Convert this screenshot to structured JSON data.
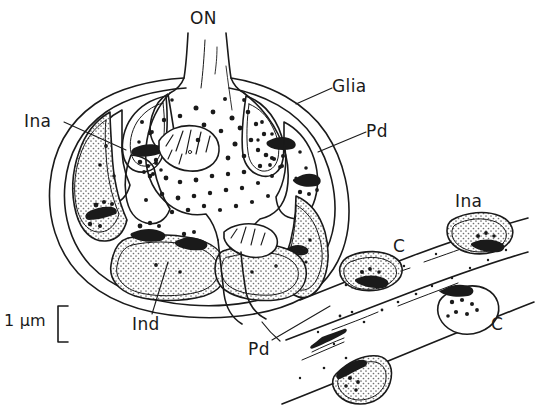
{
  "figure": {
    "domain_description": "Line drawing of a neuronal synaptic glomerulus cross-section",
    "width": 558,
    "height": 412,
    "background_color": "#ffffff",
    "ink_color": "#1a1a1a",
    "stipple_fill_color": "#d9d9d9"
  },
  "labels": {
    "optic_nerve": {
      "text": "ON",
      "x": 190,
      "y": 10
    },
    "glia": {
      "text": "Glia",
      "x": 332,
      "y": 78
    },
    "pd_upper": {
      "text": "Pd",
      "x": 366,
      "y": 123
    },
    "ina_left": {
      "text": "Ina",
      "x": 24,
      "y": 113
    },
    "ina_right": {
      "text": "Ina",
      "x": 455,
      "y": 193
    },
    "c_upper": {
      "text": "C",
      "x": 393,
      "y": 238
    },
    "c_lower": {
      "text": "C",
      "x": 491,
      "y": 316
    },
    "ind": {
      "text": "Ind",
      "x": 132,
      "y": 316
    },
    "pd_lower": {
      "text": "Pd",
      "x": 248,
      "y": 341
    },
    "scale": {
      "text": "1 µm",
      "x": 4,
      "y": 310
    }
  },
  "scale_bar": {
    "value": "1 µm",
    "bracket_x": 58,
    "bracket_top": 306,
    "bracket_bottom": 342,
    "tick_length": 10
  },
  "structures": {
    "glomerulus_outline": "large rounded cell body enclosed by glial sheath",
    "optic_nerve_stalk": "vertical stalk entering from top",
    "mitochondria_count": 2,
    "peripheral_compartments": 8,
    "detached_profiles": 4,
    "neuropil_band": "diagonal band running lower-right"
  }
}
